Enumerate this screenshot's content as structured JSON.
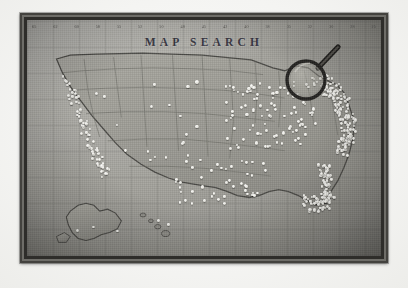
{
  "photo": {
    "subject": "framed-united-states-wall-map-with-push-pins",
    "title": "MAP SEARCH",
    "tone": "black-and-white-vintage-photograph"
  },
  "colors": {
    "paper": "#fdfdfc",
    "frame_outer": "#43423e",
    "frame_inner": "#2e2d2a",
    "map_face": "#a2a19b",
    "land": "#9b9a93",
    "coast_line": "#4a4945",
    "state_line": "#6b6a64",
    "pin_head": "#f2f1ea",
    "title_ink": "#35343f",
    "magnifier_rim": "#232220"
  },
  "ruler": {
    "name": "longitude-degree-ticks",
    "labels": [
      "65",
      "62",
      "60",
      "58",
      "55",
      "52",
      "50",
      "48",
      "45",
      "42",
      "40",
      "38",
      "35",
      "32",
      "30",
      "28",
      "25"
    ]
  },
  "map": {
    "title": "MAP SEARCH",
    "regions": [
      {
        "name": "contiguous-united-states"
      },
      {
        "name": "alaska"
      },
      {
        "name": "hawaii"
      }
    ],
    "pin_legend": {
      "label": "white push pins",
      "total": 520,
      "density": "dense on east and west coasts, sparse through the interior west"
    }
  },
  "magnifier": {
    "name": "magnifying-glass",
    "position": "over the great lakes region",
    "handle_angle_deg": 40
  },
  "chart_data": {
    "type": "scatter",
    "title": "MAP SEARCH",
    "xlabel": "",
    "ylabel": "",
    "legend": [
      "push pin"
    ],
    "series": [
      {
        "name": "push pin",
        "region_counts": [
          {
            "region": "Northeast",
            "count": 165
          },
          {
            "region": "Southeast",
            "count": 120
          },
          {
            "region": "Midwest",
            "count": 95
          },
          {
            "region": "Pacific Coast",
            "count": 70
          },
          {
            "region": "South Central",
            "count": 45
          },
          {
            "region": "Mountain West",
            "count": 20
          },
          {
            "region": "Alaska",
            "count": 3
          },
          {
            "region": "Hawaii",
            "count": 2
          }
        ]
      }
    ]
  }
}
